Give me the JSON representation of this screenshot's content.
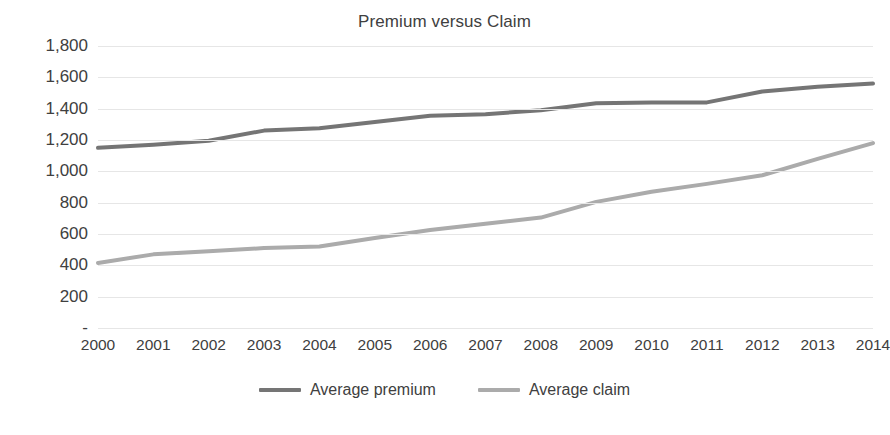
{
  "chart_data": {
    "type": "line",
    "title": "Premium versus Claim",
    "xlabel": "",
    "ylabel": "",
    "grid": true,
    "legend_position": "bottom",
    "x": [
      "2000",
      "2001",
      "2002",
      "2003",
      "2004",
      "2005",
      "2006",
      "2007",
      "2008",
      "2009",
      "2010",
      "2011",
      "2012",
      "2013",
      "2014"
    ],
    "categories": [
      "2000",
      "2001",
      "2002",
      "2003",
      "2004",
      "2005",
      "2006",
      "2007",
      "2008",
      "2009",
      "2010",
      "2011",
      "2012",
      "2013",
      "2014"
    ],
    "ylim": [
      0,
      1800
    ],
    "ytick_values": [
      1800,
      1600,
      1400,
      1200,
      1000,
      800,
      600,
      400,
      200,
      0
    ],
    "ytick_labels": [
      "1,800",
      "1,600",
      "1,400",
      "1,200",
      "1,000",
      "800",
      "600",
      "400",
      "200",
      "-"
    ],
    "series": [
      {
        "name": "Average premium",
        "color": "#757575",
        "values": [
          1150,
          1170,
          1195,
          1260,
          1275,
          1315,
          1355,
          1365,
          1390,
          1435,
          1440,
          1440,
          1510,
          1540,
          1560
        ]
      },
      {
        "name": "Average claim",
        "color": "#ababab",
        "values": [
          415,
          470,
          490,
          510,
          520,
          575,
          625,
          665,
          705,
          805,
          870,
          920,
          975,
          1080,
          1180
        ]
      }
    ]
  },
  "legend": {
    "items": [
      {
        "label": "Average premium",
        "color": "#757575"
      },
      {
        "label": "Average claim",
        "color": "#ababab"
      }
    ]
  },
  "colors": {
    "premium_line": "#757575",
    "claim_line": "#ababab",
    "gridline": "#e6e6e6",
    "text": "#404040",
    "background": "#ffffff"
  }
}
